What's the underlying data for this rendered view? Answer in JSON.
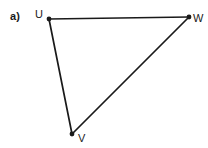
{
  "figure": {
    "part_label": "a)",
    "background_color": "#ffffff",
    "stroke_color": "#1a1a1a",
    "label_color": "#1a1a1a",
    "vertices": [
      {
        "id": "U",
        "label": "U",
        "x": 49,
        "y": 19
      },
      {
        "id": "W",
        "label": "W",
        "x": 189,
        "y": 17
      },
      {
        "id": "V",
        "label": "V",
        "x": 72,
        "y": 134
      }
    ],
    "edges": [
      {
        "id": "UW",
        "from": "U",
        "to": "W",
        "x1": 49,
        "y1": 19,
        "x2": 189,
        "y2": 17
      },
      {
        "id": "UV",
        "from": "U",
        "to": "V",
        "x1": 49,
        "y1": 19,
        "x2": 72,
        "y2": 134
      },
      {
        "id": "VW",
        "from": "V",
        "to": "W",
        "x1": 72,
        "y1": 134,
        "x2": 189,
        "y2": 17
      }
    ],
    "shape_name": "triangle-UVW",
    "vertex_dot_radius": 2.4,
    "stroke_width": 1.7
  }
}
